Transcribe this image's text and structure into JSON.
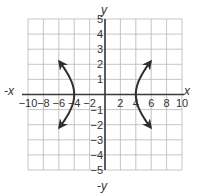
{
  "chart_data": {
    "type": "line",
    "title": "",
    "xlabel": "x",
    "ylabel": "y",
    "xlabel_neg": "-x",
    "ylabel_neg": "-y",
    "xlim": [
      -10,
      10
    ],
    "ylim": [
      -5,
      5
    ],
    "grid": true,
    "x_grid_step": 2,
    "y_grid_step": 1,
    "x_ticks": [
      -10,
      -8,
      -6,
      -4,
      -2,
      2,
      4,
      6,
      8,
      10
    ],
    "y_ticks": [
      -5,
      -4,
      -3,
      -2,
      -1,
      1,
      2,
      3,
      4,
      5
    ],
    "x_tick_labels": [
      "−10",
      "−8",
      "−6",
      "−4",
      "−2",
      "2",
      "4",
      "6",
      "8",
      "10"
    ],
    "y_tick_labels": [
      "−5",
      "−4",
      "−3",
      "−2",
      "−1",
      "1",
      "2",
      "3",
      "4",
      "5"
    ],
    "equation": "x^2/16 - y^2/4 = 1",
    "series": [
      {
        "name": "right branch",
        "vertex": [
          4,
          0
        ],
        "points": [
          [
            9.2,
            2.2
          ],
          [
            7,
            1.44
          ],
          [
            5.5,
            0.94
          ],
          [
            4.5,
            0.52
          ],
          [
            4,
            0
          ],
          [
            4.5,
            -0.52
          ],
          [
            5.5,
            -0.94
          ],
          [
            7,
            -1.44
          ],
          [
            9.2,
            -2.2
          ]
        ],
        "arrows": "both ends"
      },
      {
        "name": "left branch",
        "vertex": [
          -4,
          0
        ],
        "points": [
          [
            -9.2,
            2.2
          ],
          [
            -7,
            1.44
          ],
          [
            -5.5,
            0.94
          ],
          [
            -4.5,
            0.52
          ],
          [
            -4,
            0
          ],
          [
            -4.5,
            -0.52
          ],
          [
            -5.5,
            -0.94
          ],
          [
            -7,
            -1.44
          ],
          [
            -9.2,
            -2.2
          ]
        ],
        "arrows": "both ends"
      }
    ],
    "colors": {
      "grid": "#b8b8b8",
      "axes": "#3a3a3a",
      "curve": "#2e2e2e",
      "text": "#333333"
    }
  }
}
